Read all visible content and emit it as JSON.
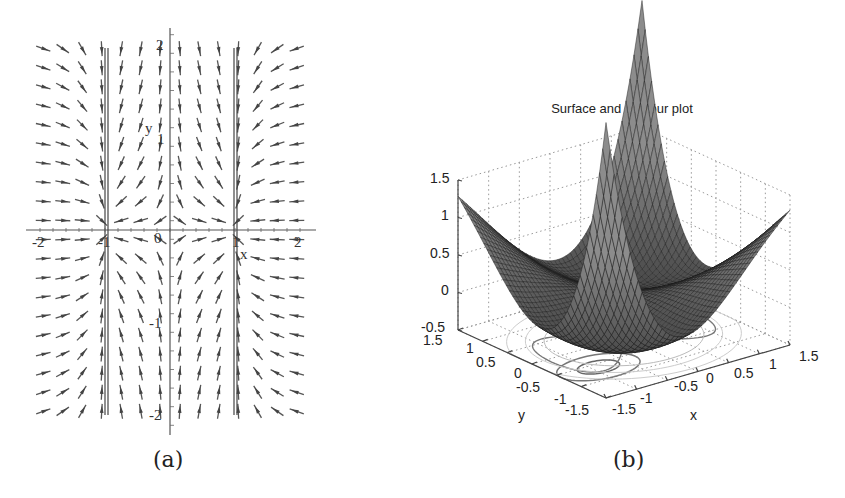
{
  "panel_a": {
    "caption": "(a)",
    "x_axis_label": "x",
    "y_axis_label": "y",
    "x_ticks": [
      "-2",
      "-1",
      "0",
      "1",
      "2"
    ],
    "y_ticks": [
      "2",
      "1",
      "-1",
      "-2"
    ]
  },
  "panel_b": {
    "caption": "(b)",
    "title": "Surface and contour plot",
    "z_ticks": [
      "1.5",
      "1",
      "0.5",
      "0",
      "-0.5"
    ],
    "y_ticks": [
      "1.5",
      "1",
      "0.5",
      "0",
      "-0.5",
      "-1",
      "-1.5"
    ],
    "x_ticks": [
      "-1.5",
      "-1",
      "-0.5",
      "0",
      "0.5",
      "1",
      "1.5"
    ],
    "x_label": "x",
    "y_label": "y"
  },
  "chart_data": [
    {
      "type": "vector-field",
      "title": "",
      "xlabel": "x",
      "ylabel": "y",
      "xlim": [
        -2,
        2
      ],
      "ylim": [
        -2,
        2
      ],
      "x_ticks": [
        -2,
        -1,
        0,
        1,
        2
      ],
      "y_ticks": [
        -2,
        -1,
        1,
        2
      ],
      "field": "dx/dt = x - x^3, dy/dt = -y (direction field, normalized arrows)",
      "nullclines_vertical": [
        -1,
        0,
        1
      ],
      "grid": false,
      "grid_cols": 14,
      "grid_rows": 20
    },
    {
      "type": "surface3d",
      "title": "Surface and contour plot",
      "xlabel": "x",
      "ylabel": "y",
      "zlabel": "",
      "xlim": [
        -1.5,
        1.5
      ],
      "ylim": [
        -1.5,
        1.5
      ],
      "zlim": [
        -0.5,
        1.5
      ],
      "x_ticks": [
        -1.5,
        -1,
        -0.5,
        0,
        0.5,
        1,
        1.5
      ],
      "y_ticks": [
        -1.5,
        -1,
        -0.5,
        0,
        0.5,
        1,
        1.5
      ],
      "z_ticks": [
        -0.5,
        0,
        0.5,
        1,
        1.5
      ],
      "surface": "double-well potential with two minima (~0) near (-1,-1) and (1,1); corner heights up to ~1.3",
      "contours_on_base": true,
      "grid": true,
      "colormap": "gray"
    }
  ]
}
